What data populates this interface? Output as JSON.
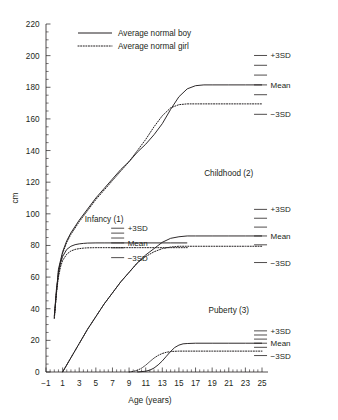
{
  "chart_data": {
    "type": "line",
    "title": "",
    "xlabel": "Age (years)",
    "ylabel": "cm",
    "xlim": [
      -1,
      25
    ],
    "ylim": [
      0,
      220
    ],
    "xticks": [
      -1,
      1,
      3,
      5,
      7,
      9,
      11,
      13,
      15,
      17,
      19,
      21,
      23,
      25
    ],
    "yticks": [
      0,
      20,
      40,
      60,
      80,
      100,
      120,
      140,
      160,
      180,
      200,
      220
    ],
    "xtick_labels": [
      "−1",
      "1",
      "3",
      "5",
      "7",
      "9",
      "11",
      "13",
      "15",
      "17",
      "19",
      "21",
      "23",
      "25"
    ],
    "ytick_labels": [
      "0",
      "20",
      "40",
      "60",
      "80",
      "100",
      "120",
      "140",
      "160",
      "180",
      "200",
      "220"
    ],
    "x_minor_step": 0.5,
    "y_minor_step": 5,
    "grid": false,
    "legend_position": "top-left",
    "legend": [
      {
        "name": "Average normal boy",
        "style": "solid"
      },
      {
        "name": "Average normal girl",
        "style": "dotted"
      }
    ],
    "series": [
      {
        "name": "Total height boy",
        "sex": "boy",
        "style": "solid",
        "x": [
          0,
          0.5,
          1,
          1.5,
          2,
          3,
          4,
          5,
          6,
          7,
          8,
          9,
          10,
          11,
          12,
          13,
          14,
          15,
          16,
          17,
          18,
          19,
          21,
          23,
          25
        ],
        "y": [
          35,
          65,
          76,
          83,
          88,
          96,
          103,
          110,
          116,
          122,
          128,
          133,
          139,
          144,
          150,
          157,
          166,
          174,
          179,
          181,
          181.5,
          181.5,
          181.5,
          181.5,
          181.5
        ]
      },
      {
        "name": "Total height girl",
        "sex": "girl",
        "style": "dotted",
        "x": [
          0,
          0.5,
          1,
          1.5,
          2,
          3,
          4,
          5,
          6,
          7,
          8,
          9,
          10,
          11,
          12,
          13,
          14,
          15,
          16,
          17,
          18,
          19,
          21,
          23,
          25
        ],
        "y": [
          34,
          64,
          75,
          82,
          87,
          95,
          102,
          109,
          115,
          121,
          127,
          133,
          140,
          147,
          155,
          162,
          167,
          169,
          169.5,
          169.5,
          169.5,
          169.5,
          169.5,
          169.5,
          169.5
        ]
      },
      {
        "name": "Infancy component boy",
        "sex": "boy",
        "style": "solid",
        "component": "infancy",
        "x": [
          0,
          0.25,
          0.5,
          0.75,
          1,
          1.5,
          2,
          2.5,
          3,
          3.5,
          4,
          5,
          6,
          8,
          10,
          12,
          14,
          16
        ],
        "y": [
          35,
          52,
          62,
          69,
          73,
          77.5,
          79.5,
          80.5,
          81,
          81.3,
          81.5,
          81.6,
          81.6,
          81.6,
          81.6,
          81.6,
          81.6,
          81.6
        ]
      },
      {
        "name": "Infancy component girl",
        "sex": "girl",
        "style": "dotted",
        "component": "infancy",
        "x": [
          0,
          0.25,
          0.5,
          0.75,
          1,
          1.5,
          2,
          2.5,
          3,
          3.5,
          4,
          5,
          6,
          8,
          10,
          12,
          14,
          16
        ],
        "y": [
          34,
          50,
          60,
          66.5,
          70.5,
          74.5,
          76.5,
          77.5,
          78,
          78.3,
          78.5,
          78.6,
          78.6,
          78.6,
          78.6,
          78.6,
          78.6,
          78.6
        ]
      },
      {
        "name": "Childhood component boy",
        "sex": "boy",
        "style": "solid",
        "component": "childhood",
        "x": [
          1,
          2,
          3,
          4,
          5,
          6,
          7,
          8,
          9,
          10,
          11,
          12,
          13,
          14,
          15,
          16,
          17,
          19,
          21,
          23,
          25
        ],
        "y": [
          0,
          9,
          18,
          27,
          35,
          43,
          50,
          57,
          63,
          69,
          74,
          78,
          82,
          84.5,
          85.5,
          86,
          86,
          86,
          86,
          86,
          86
        ]
      },
      {
        "name": "Childhood component girl",
        "sex": "girl",
        "style": "dotted",
        "component": "childhood",
        "x": [
          1,
          2,
          3,
          4,
          5,
          6,
          7,
          8,
          9,
          10,
          11,
          12,
          13,
          14,
          15,
          16,
          17,
          19,
          21,
          23,
          25
        ],
        "y": [
          0,
          9,
          18,
          27,
          35,
          43,
          50,
          57,
          63,
          69,
          73,
          76,
          78,
          79,
          79.5,
          79.5,
          79.5,
          79.5,
          79.5,
          79.5,
          79.5
        ]
      },
      {
        "name": "Puberty component boy",
        "sex": "boy",
        "style": "solid",
        "component": "puberty",
        "x": [
          10,
          11,
          11.5,
          12,
          12.5,
          13,
          13.5,
          14,
          14.5,
          15,
          15.5,
          16,
          17,
          19,
          21,
          23,
          25
        ],
        "y": [
          0,
          0.5,
          1.2,
          2.5,
          4.5,
          7,
          10,
          13,
          15.5,
          17,
          17.8,
          18,
          18.2,
          18.2,
          18.2,
          18.2,
          18.2
        ]
      },
      {
        "name": "Puberty component girl",
        "sex": "girl",
        "style": "dotted",
        "component": "puberty",
        "x": [
          9,
          9.5,
          10,
          10.5,
          11,
          11.5,
          12,
          12.5,
          13,
          13.5,
          14,
          14.5,
          15,
          16,
          17,
          19,
          21,
          23,
          25
        ],
        "y": [
          0,
          0.4,
          1.1,
          2.4,
          4.3,
          6.6,
          8.8,
          10.5,
          11.7,
          12.5,
          12.9,
          13.1,
          13.2,
          13.2,
          13.2,
          13.2,
          13.2,
          13.2,
          13.2
        ]
      }
    ],
    "sd_ladders": [
      {
        "id": "total",
        "label": "",
        "x_center": 23.2,
        "center_value": 181.5,
        "sd_step": 6.2,
        "ticks": [
          3,
          2,
          1,
          0,
          -1,
          -3
        ],
        "labels": {
          "+3SD": "+3SD",
          "Mean": "Mean",
          "-3SD": "−3SD"
        }
      },
      {
        "id": "infancy",
        "label": "Infancy (1)",
        "x_center": 6.0,
        "center_value": 81.6,
        "sd_step": 3.1,
        "ticks": [
          3,
          2,
          1,
          0,
          -1,
          -3
        ],
        "labels": {
          "+3SD": "+3SD",
          "Mean": "Mean",
          "-3SD": "−3SD"
        }
      },
      {
        "id": "childhood",
        "label": "Childhood (2)",
        "x_center": 23.2,
        "center_value": 86.0,
        "sd_step": 5.6,
        "ticks": [
          3,
          2,
          1,
          0,
          -1,
          -3
        ],
        "labels": {
          "+3SD": "+3SD",
          "Mean": "Mean",
          "-3SD": "−3SD"
        }
      },
      {
        "id": "puberty",
        "label": "Puberty (3)",
        "x_center": 23.2,
        "center_value": 18.2,
        "sd_step": 2.6,
        "ticks": [
          3,
          2,
          1,
          0,
          -1,
          -3
        ],
        "labels": {
          "+3SD": "+3SD",
          "Mean": "Mean",
          "-3SD": "−3SD"
        }
      }
    ],
    "annotations": [
      {
        "text": "Infancy (1)",
        "x": 6.0,
        "y": 95
      },
      {
        "text": "Childhood (2)",
        "x": 21.0,
        "y": 124
      },
      {
        "text": "Puberty (3)",
        "x": 21.0,
        "y": 37
      }
    ],
    "sd_label_texts": {
      "plus": "+3SD",
      "mean": "Mean",
      "minus": "−3SD"
    }
  },
  "colors": {
    "ink": "#231f20",
    "background": "#ffffff"
  }
}
